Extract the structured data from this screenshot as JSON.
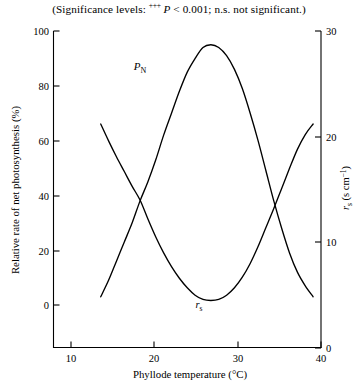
{
  "caption": {
    "prefix": "(Significance levels: ",
    "sup": "+++",
    "p_italic": "P",
    "p_rest": " < 0.001; n.s. not significant.)"
  },
  "chart_data": {
    "type": "line",
    "title": "",
    "xlabel": "Phyllode temperature (°C)",
    "ylabel_left": "Relative rate of net photosynthesis (%)",
    "ylabel_right": "r",
    "ylabel_right_sub": "s",
    "ylabel_right_units": " (s cm",
    "ylabel_right_exp": "−1",
    "ylabel_right_close": ")",
    "xlim": [
      7,
      41
    ],
    "ylim_left": [
      0,
      100
    ],
    "ylim_right": [
      0,
      30
    ],
    "xticks": [
      10,
      20,
      30,
      40
    ],
    "yticks_left": [
      0,
      20,
      40,
      60,
      80,
      100
    ],
    "yticks_right": [
      0,
      10,
      20,
      30
    ],
    "grid": false,
    "legend": "inline-labels",
    "series": [
      {
        "name": "P_N",
        "label": "P",
        "label_sub": "N",
        "axis": "left",
        "units": "%",
        "x": [
          13,
          14,
          15,
          16,
          17,
          18,
          19,
          20,
          21,
          22,
          23,
          24,
          25,
          26,
          27,
          28,
          29,
          30,
          31,
          32,
          33,
          34,
          35,
          36,
          37,
          38,
          39,
          40
        ],
        "y": [
          3,
          9,
          16,
          23,
          30,
          38,
          45,
          53,
          62,
          70,
          78,
          85,
          90,
          94,
          95,
          94,
          91,
          86,
          79,
          70,
          60,
          49,
          38,
          28,
          19,
          12,
          7,
          3
        ]
      },
      {
        "name": "r_s",
        "label": "r",
        "label_sub": "s",
        "axis": "right",
        "units": "s cm−1",
        "x": [
          13,
          14,
          15,
          16,
          17,
          18,
          19,
          20,
          21,
          22,
          23,
          24,
          25,
          26,
          27,
          28,
          29,
          30,
          31,
          32,
          33,
          34,
          35,
          36,
          37,
          38,
          39,
          40
        ],
        "y": [
          21.2,
          19.6,
          18.1,
          16.7,
          15.3,
          14.0,
          12.2,
          10.5,
          9.0,
          7.7,
          6.6,
          5.7,
          5.0,
          4.6,
          4.5,
          4.6,
          5.0,
          5.7,
          6.7,
          8.0,
          9.6,
          11.4,
          13.2,
          15.1,
          17.0,
          18.8,
          20.2,
          21.2
        ]
      }
    ],
    "annotations": [
      {
        "name": "pn-curve-label",
        "text": "P",
        "sub": "N",
        "x": 140,
        "y": 70
      },
      {
        "name": "rs-curve-label",
        "text": "r",
        "sub": "s",
        "x": 199,
        "y": 308
      }
    ]
  }
}
